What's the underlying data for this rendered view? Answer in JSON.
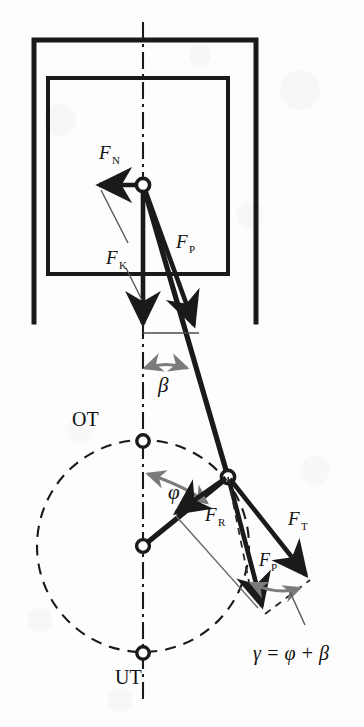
{
  "figure": {
    "kind": "engineering-diagram",
    "background_color": "#fdfdfd",
    "ink_color": "#1a1a1a",
    "accent_gray": "#7b7b7b"
  },
  "labels": {
    "normal_force": "F",
    "normal_force_sub": "N",
    "piston_force": "F",
    "piston_force_sub": "K",
    "rod_force": "F",
    "rod_force_sub": "P",
    "radial_force": "F",
    "radial_force_sub": "R",
    "tangential_force": "F",
    "tangential_force_sub": "T",
    "rod_force_crank": "F",
    "rod_force_crank_sub": "P",
    "angle_beta": "β",
    "angle_phi": "φ",
    "gamma_relation": "γ = φ + β",
    "top_dead_center": "OT",
    "bottom_dead_center": "UT"
  },
  "geometry": {
    "piston_pin": {
      "x": 143,
      "y": 185
    },
    "crank_pin": {
      "x": 228,
      "y": 477
    },
    "crank_center": {
      "x": 143,
      "y": 546
    },
    "top_dead_center_point": {
      "x": 143,
      "y": 441
    },
    "bottom_dead_center_point": {
      "x": 143,
      "y": 653
    },
    "crank_radius": 106,
    "centerline_x": 143,
    "cylinder_outer": {
      "x": 34,
      "y": 40,
      "w": 222,
      "h": 282
    },
    "piston_rect": {
      "x": 48,
      "y": 78,
      "w": 180,
      "h": 196
    }
  },
  "vectors": {
    "FN": {
      "from": [
        143,
        185
      ],
      "to": [
        95,
        185
      ],
      "style": "thick-black"
    },
    "FK": {
      "from": [
        143,
        185
      ],
      "to": [
        143,
        332
      ],
      "style": "thick-black"
    },
    "FP_piston": {
      "from": [
        143,
        185
      ],
      "to": [
        196,
        332
      ],
      "style": "thick-black"
    },
    "FR": {
      "from": [
        228,
        477
      ],
      "to": [
        172,
        516
      ],
      "style": "thick-black"
    },
    "FT": {
      "from": [
        228,
        477
      ],
      "to": [
        310,
        580
      ],
      "style": "thick-black"
    },
    "FP_crank": {
      "from": [
        228,
        477
      ],
      "to": [
        265,
        614
      ],
      "style": "thick-black"
    }
  }
}
